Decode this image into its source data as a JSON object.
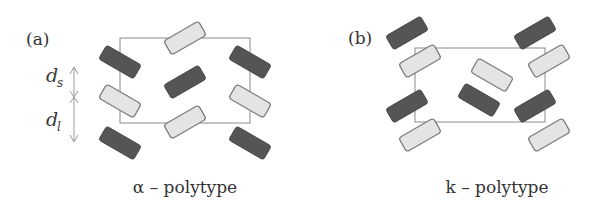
{
  "figure": {
    "panels": [
      {
        "id": "a",
        "label": "(a)",
        "caption": "α – polytype",
        "spacing_labels": {
          "short": {
            "symbol": "d",
            "subscript": "s"
          },
          "long": {
            "symbol": "d",
            "subscript": "l"
          }
        },
        "tiles": [
          {
            "shade": "light",
            "orientation": "rising"
          },
          {
            "shade": "dark",
            "orientation": "falling"
          },
          {
            "shade": "light",
            "orientation": "falling"
          },
          {
            "shade": "dark",
            "orientation": "falling"
          },
          {
            "shade": "dark",
            "orientation": "rising"
          },
          {
            "shade": "light",
            "orientation": "rising"
          },
          {
            "shade": "dark",
            "orientation": "falling"
          },
          {
            "shade": "light",
            "orientation": "falling"
          },
          {
            "shade": "dark",
            "orientation": "falling"
          }
        ]
      },
      {
        "id": "b",
        "label": "(b)",
        "caption": "k – polytype",
        "tiles": [
          {
            "shade": "dark",
            "orientation": "rising"
          },
          {
            "shade": "light",
            "orientation": "rising"
          },
          {
            "shade": "dark",
            "orientation": "rising"
          },
          {
            "shade": "light",
            "orientation": "rising"
          },
          {
            "shade": "light",
            "orientation": "falling"
          },
          {
            "shade": "dark",
            "orientation": "falling"
          },
          {
            "shade": "dark",
            "orientation": "rising"
          },
          {
            "shade": "light",
            "orientation": "rising"
          },
          {
            "shade": "dark",
            "orientation": "rising"
          },
          {
            "shade": "light",
            "orientation": "rising"
          }
        ]
      }
    ],
    "colors": {
      "dark_tile": "#555555",
      "light_tile": "#e4e4e4",
      "cell_outline": "#8a8a8a"
    }
  }
}
